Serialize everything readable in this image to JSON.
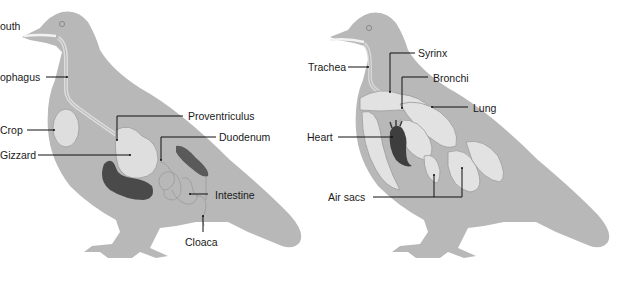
{
  "colors": {
    "background": "#ffffff",
    "silhouette": "#b8b8b8",
    "organ_light": "#dedede",
    "organ_outline": "#9a9a9a",
    "organ_dark": "#4a4a4a",
    "leader_line": "#111111",
    "label_text": "#1a1a1a"
  },
  "digestive_diagram": {
    "labels": [
      {
        "id": "mouth",
        "text": "outh"
      },
      {
        "id": "esophagus",
        "text": "ophagus"
      },
      {
        "id": "crop",
        "text": "Crop"
      },
      {
        "id": "gizzard",
        "text": "Gizzard"
      },
      {
        "id": "proventriculus",
        "text": "Proventriculus"
      },
      {
        "id": "duodenum",
        "text": "Duodenum"
      },
      {
        "id": "intestine",
        "text": "Intestine"
      },
      {
        "id": "cloaca",
        "text": "Cloaca"
      }
    ]
  },
  "respiratory_diagram": {
    "labels": [
      {
        "id": "trachea",
        "text": "Trachea"
      },
      {
        "id": "syrinx",
        "text": "Syrinx"
      },
      {
        "id": "bronchi",
        "text": "Bronchi"
      },
      {
        "id": "lung",
        "text": "Lung"
      },
      {
        "id": "heart",
        "text": "Heart"
      },
      {
        "id": "air_sacs",
        "text": "Air sacs"
      }
    ]
  }
}
